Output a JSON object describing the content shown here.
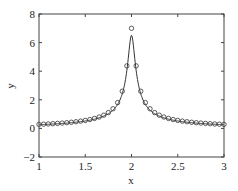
{
  "chart_data": {
    "type": "line",
    "title": "",
    "xlabel": "x",
    "ylabel": "y",
    "xlim": [
      1,
      3
    ],
    "ylim": [
      -2,
      8
    ],
    "xticks": [
      "1",
      "1.5",
      "2",
      "2.5",
      "3"
    ],
    "yticks": [
      "-2",
      "0",
      "2",
      "4",
      "6",
      "8"
    ],
    "grid": false,
    "legend": null,
    "series": [
      {
        "name": "curve",
        "style": "solid line + open circle markers",
        "color": "#333333",
        "x": [
          1.0,
          1.05,
          1.1,
          1.15,
          1.2,
          1.25,
          1.3,
          1.35,
          1.4,
          1.45,
          1.5,
          1.55,
          1.6,
          1.65,
          1.7,
          1.75,
          1.8,
          1.85,
          1.9,
          1.95,
          2.0,
          2.05,
          2.1,
          2.15,
          2.2,
          2.25,
          2.3,
          2.35,
          2.4,
          2.45,
          2.5,
          2.55,
          2.6,
          2.65,
          2.7,
          2.75,
          2.8,
          2.85,
          2.9,
          2.95,
          3.0
        ],
        "y": [
          0.28,
          0.294,
          0.311,
          0.329,
          0.35,
          0.373,
          0.399,
          0.43,
          0.466,
          0.508,
          0.558,
          0.62,
          0.697,
          0.796,
          0.925,
          1.106,
          1.373,
          1.804,
          2.6,
          4.373,
          7.0,
          4.373,
          2.6,
          1.804,
          1.373,
          1.106,
          0.925,
          0.796,
          0.697,
          0.62,
          0.558,
          0.508,
          0.466,
          0.43,
          0.399,
          0.373,
          0.35,
          0.329,
          0.311,
          0.294,
          0.28
        ]
      }
    ]
  }
}
